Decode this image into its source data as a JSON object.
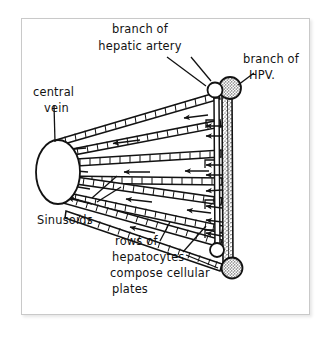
{
  "figure": {
    "style": "hand-drawn ink sketch",
    "background_color": "#ffffff",
    "ink_color": "#121212",
    "frame_color": "#c9c9c9"
  },
  "labels": {
    "hepatic_artery": {
      "line1": "branch of",
      "line2": "hepatic artery"
    },
    "hpv": {
      "line1": "branch of",
      "line2": "HPV."
    },
    "central_vein": {
      "line1": "central",
      "line2": "vein"
    },
    "sinusoids": {
      "line1": "Sinusoids"
    },
    "hepatocytes": {
      "line1": "rows of",
      "line2": "hepatocytes",
      "line3": "compose cellular",
      "line4": "plates"
    }
  },
  "structures": {
    "central_vein_name": "central vein",
    "portal_vein_name": "branch of hepatic portal vein",
    "hepatic_artery_name": "branch of hepatic artery",
    "plate_count": 4,
    "flow_direction": "right to left, from portal triad toward central vein"
  }
}
